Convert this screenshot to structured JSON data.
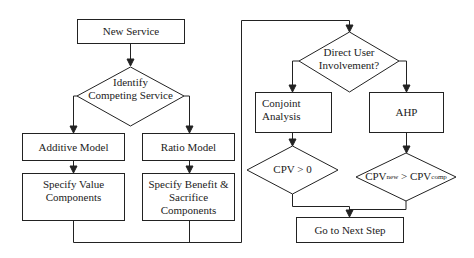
{
  "diagram": {
    "type": "flowchart",
    "nodes": {
      "new_service": {
        "label": "New Service",
        "shape": "box"
      },
      "identify": {
        "label_line1": "Identify",
        "label_line2": "Competing Service",
        "shape": "diamond"
      },
      "additive": {
        "label": "Additive Model",
        "shape": "box"
      },
      "ratio": {
        "label": "Ratio Model",
        "shape": "box"
      },
      "specify_value": {
        "label_line1": "Specify Value",
        "label_line2": "Components",
        "shape": "box"
      },
      "specify_benefit": {
        "label_line1": "Specify Benefit &",
        "label_line2": "Sacrifice",
        "label_line3": "Components",
        "shape": "box"
      },
      "direct_user": {
        "label_line1": "Direct User",
        "label_line2": "Involvement?",
        "shape": "diamond"
      },
      "conjoint": {
        "label_line1": "Conjoint",
        "label_line2": "Analysis",
        "shape": "box"
      },
      "ahp": {
        "label": "AHP",
        "shape": "box"
      },
      "cpv_zero": {
        "label": "CPV > 0",
        "shape": "diamond"
      },
      "cpv_compare": {
        "main1": "CPV",
        "sub1": "new",
        "main2": " > CPV",
        "sub2": "comp",
        "shape": "diamond"
      },
      "next_step": {
        "label": "Go to Next Step",
        "shape": "box"
      }
    },
    "edges": [
      [
        "new_service",
        "identify"
      ],
      [
        "identify",
        "additive"
      ],
      [
        "identify",
        "ratio"
      ],
      [
        "additive",
        "specify_value"
      ],
      [
        "ratio",
        "specify_benefit"
      ],
      [
        "specify_value",
        "direct_user"
      ],
      [
        "specify_benefit",
        "direct_user"
      ],
      [
        "direct_user",
        "conjoint"
      ],
      [
        "direct_user",
        "ahp"
      ],
      [
        "conjoint",
        "cpv_zero"
      ],
      [
        "ahp",
        "cpv_compare"
      ],
      [
        "cpv_zero",
        "next_step"
      ],
      [
        "cpv_compare",
        "next_step"
      ]
    ],
    "colors": {
      "stroke": "#222222",
      "background": "#ffffff"
    }
  }
}
